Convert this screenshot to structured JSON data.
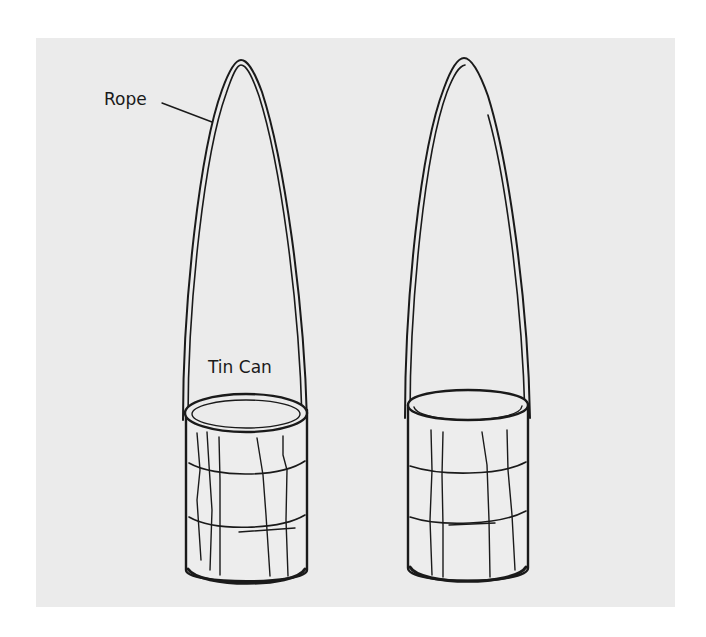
{
  "figure": {
    "labels": {
      "rope": "Rope",
      "tin_can": "Tin Can"
    },
    "colors": {
      "background": "#ffffff",
      "panel": "#ebebeb",
      "ink": "#1a1a1a",
      "can_fill": "#ededed"
    },
    "objects": [
      {
        "name": "left-rope-and-can",
        "rope_label": "Rope",
        "can_label": "Tin Can"
      },
      {
        "name": "right-rope-and-can"
      }
    ]
  }
}
